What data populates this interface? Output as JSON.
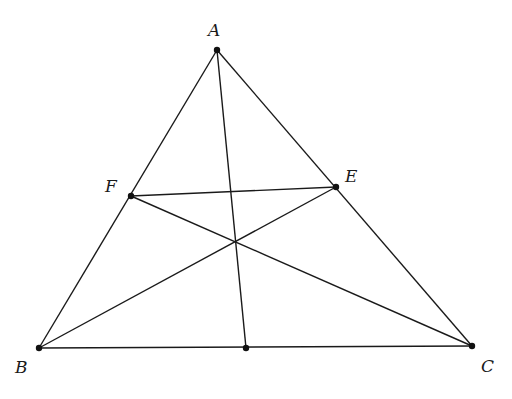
{
  "diagram": {
    "type": "triangle-cevians",
    "points": {
      "A": {
        "label": "A",
        "x": 217,
        "y": 50,
        "lx": 208,
        "ly": 36
      },
      "B": {
        "label": "B",
        "x": 39,
        "y": 348,
        "lx": 15,
        "ly": 373
      },
      "C": {
        "label": "C",
        "x": 472,
        "y": 346,
        "lx": 481,
        "ly": 372
      },
      "E": {
        "label": "E",
        "x": 336,
        "y": 187,
        "lx": 345,
        "ly": 182
      },
      "F": {
        "label": "F",
        "x": 131,
        "y": 196,
        "lx": 105,
        "ly": 192
      },
      "D": {
        "label": "",
        "x": 246,
        "y": 348
      }
    },
    "segments": [
      [
        "A",
        "B"
      ],
      [
        "A",
        "C"
      ],
      [
        "B",
        "C"
      ],
      [
        "A",
        "D"
      ],
      [
        "B",
        "E"
      ],
      [
        "C",
        "F"
      ],
      [
        "F",
        "E"
      ]
    ],
    "colors": {
      "stroke": "#1a1a1a",
      "background": "#ffffff"
    }
  }
}
